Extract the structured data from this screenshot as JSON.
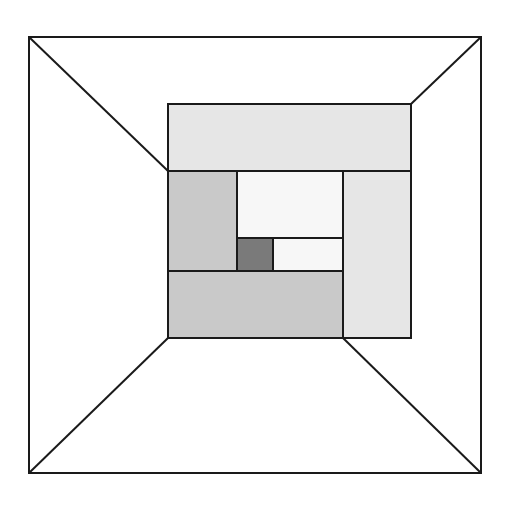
{
  "diagram": {
    "type": "nested-rectangles-perspective",
    "canvas": {
      "width": 512,
      "height": 506,
      "background": "#ffffff"
    },
    "stroke": {
      "color": "#1a1a1a",
      "width": 2
    },
    "outer_frame": {
      "x1": 29,
      "y1": 37,
      "x2": 481,
      "y2": 473
    },
    "perspective_lines": [
      {
        "name": "top-left-diagonal",
        "x1": 29,
        "y1": 37,
        "x2": 168,
        "y2": 171
      },
      {
        "name": "top-right-diagonal",
        "x1": 481,
        "y1": 37,
        "x2": 411,
        "y2": 104
      },
      {
        "name": "bottom-left-diagonal",
        "x1": 29,
        "y1": 473,
        "x2": 168,
        "y2": 338
      },
      {
        "name": "bottom-right-diagonal",
        "x1": 481,
        "y1": 473,
        "x2": 343,
        "y2": 338
      }
    ],
    "panels": [
      {
        "name": "top-band-panel",
        "x1": 168,
        "y1": 104,
        "x2": 411,
        "y2": 171,
        "fill": "#e6e6e6"
      },
      {
        "name": "right-column-panel",
        "x1": 343,
        "y1": 171,
        "x2": 411,
        "y2": 338,
        "fill": "#e6e6e6"
      },
      {
        "name": "left-column-panel",
        "x1": 168,
        "y1": 171,
        "x2": 237,
        "y2": 271,
        "fill": "#c9c9c9"
      },
      {
        "name": "bottom-band-panel",
        "x1": 168,
        "y1": 271,
        "x2": 343,
        "y2": 338,
        "fill": "#c9c9c9"
      },
      {
        "name": "center-white-panel",
        "x1": 237,
        "y1": 171,
        "x2": 343,
        "y2": 238,
        "fill": "#f7f7f7"
      },
      {
        "name": "small-white-panel",
        "x1": 273,
        "y1": 238,
        "x2": 343,
        "y2": 271,
        "fill": "#f7f7f7"
      },
      {
        "name": "dark-core-square",
        "x1": 237,
        "y1": 238,
        "x2": 273,
        "y2": 271,
        "fill": "#7a7a7a"
      }
    ]
  }
}
